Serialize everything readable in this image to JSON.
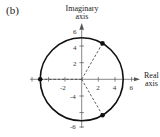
{
  "figure": {
    "part_label": "(b)",
    "imaginary_axis_label_line1": "Imaginary",
    "imaginary_axis_label_line2": "axis",
    "real_axis_label_line1": "Real",
    "real_axis_label_line2": "axis"
  },
  "axes": {
    "real_ticks": [
      "-2",
      "2",
      "4",
      "6"
    ],
    "imag_ticks": [
      "6",
      "4",
      "2",
      "-4",
      "-6"
    ]
  },
  "circle": {
    "center": [
      0,
      0
    ],
    "radius": 5
  },
  "points": [
    {
      "label": "-5",
      "re": -5,
      "im": 0
    },
    {
      "label": "5(cos60°+i sin60°)",
      "re": 2.5,
      "im": 4.33
    },
    {
      "label": "5(cos300°+i sin300°)",
      "re": 2.5,
      "im": -4.33
    }
  ],
  "colors": {
    "stroke": "#111111",
    "axis": "#555555",
    "text": "#222222"
  }
}
